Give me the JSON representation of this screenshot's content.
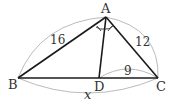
{
  "diagram": {
    "type": "triangle-angle-bisector",
    "points": {
      "A": {
        "label": "A",
        "x": 106,
        "y": 17
      },
      "B": {
        "label": "B",
        "x": 18,
        "y": 78
      },
      "C": {
        "label": "C",
        "x": 158,
        "y": 78
      },
      "D": {
        "label": "D",
        "x": 99,
        "y": 78
      }
    },
    "segments": [
      {
        "from": "A",
        "to": "B"
      },
      {
        "from": "A",
        "to": "C"
      },
      {
        "from": "B",
        "to": "C"
      },
      {
        "from": "A",
        "to": "D"
      }
    ],
    "measurements": {
      "AB": "16",
      "AC": "12",
      "DC": "9",
      "BC": "x"
    },
    "angle_marks": "equal angles BAD and DAC (angle bisector AD)",
    "colors": {
      "line": "#1a1a1a",
      "arc": "#bbbbbb",
      "text": "#333333"
    }
  }
}
